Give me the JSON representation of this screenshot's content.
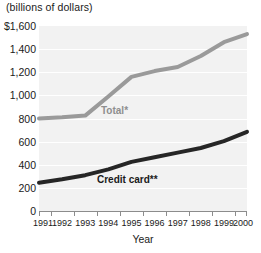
{
  "units_label": "(billions of dollars)",
  "x_axis_title": "Year",
  "series_labels": {
    "total": "Total*",
    "credit_card": "Credit card**"
  },
  "axis": {
    "y_ticks": [
      "$1,600",
      "1,400",
      "1,200",
      "1,000",
      "800",
      "600",
      "400",
      "200",
      "0"
    ],
    "x_ticks": [
      "1991",
      "1992",
      "1993",
      "1994",
      "1995",
      "1996",
      "1997",
      "1998",
      "1999",
      "2000"
    ]
  },
  "colors": {
    "total_line": "#9a9a9a",
    "credit_card_line": "#262626",
    "plot_background": "#f2f2f2",
    "gridline": "#ffffff",
    "axis": "#8c8c8c",
    "text": "#1a1a1a"
  },
  "chart_data": {
    "type": "line",
    "title": "(billions of dollars)",
    "subtitle": "",
    "xlabel": "Year",
    "ylabel": "(billions of dollars)",
    "x": [
      1991,
      1992,
      1993,
      1994,
      1995,
      1996,
      1997,
      1998,
      1999,
      2000
    ],
    "categories": [
      "1991",
      "1992",
      "1993",
      "1994",
      "1995",
      "1996",
      "1997",
      "1998",
      "1999",
      "2000"
    ],
    "series": [
      {
        "name": "Total*",
        "color": "#9a9a9a",
        "values": [
          800,
          810,
          825,
          990,
          1160,
          1210,
          1245,
          1340,
          1460,
          1530
        ]
      },
      {
        "name": "Credit card**",
        "color": "#262626",
        "values": [
          245,
          275,
          310,
          360,
          425,
          465,
          505,
          545,
          605,
          685
        ]
      }
    ],
    "ylim": [
      0,
      1600
    ],
    "ytick_values": [
      1600,
      1400,
      1200,
      1000,
      800,
      600,
      400,
      200,
      0
    ],
    "xlim": [
      1991,
      2000
    ],
    "grid": true,
    "grid_orientation": "horizontal",
    "legend": "inline-series-labels",
    "annotations": [
      "*",
      "**"
    ]
  }
}
